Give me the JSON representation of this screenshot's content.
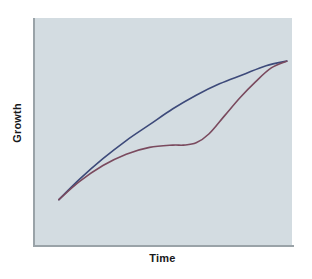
{
  "chart_data": {
    "type": "line",
    "title": "",
    "subtitle": "",
    "xlabel": "Time",
    "ylabel": "Growth",
    "grid": false,
    "legend": false,
    "legend_position": "none",
    "axis_ticks": false,
    "tick_labels": false,
    "xlim": [
      0,
      100
    ],
    "ylim": [
      0,
      100
    ],
    "plot_background": "#d3dce1",
    "figure_background": "#ffffff",
    "axis_color": "#9aa3a8",
    "axis_label_color": "#17191b",
    "annotations": [],
    "series": [
      {
        "name": "smooth-growth-curve",
        "color": "#3d4a7a",
        "line_width": 1.6,
        "shape": "concave-down steady growth",
        "x": [
          10,
          18,
          27,
          36,
          45,
          54,
          63,
          72,
          81,
          90,
          98
        ],
        "y": [
          20,
          29,
          38,
          46,
          53,
          60,
          66,
          71,
          75,
          79,
          81
        ]
      },
      {
        "name": "plateau-growth-curve",
        "color": "#7a4a5e",
        "line_width": 1.6,
        "shape": "rise, plateau, then steep rise to converge",
        "x": [
          10,
          18,
          27,
          36,
          45,
          54,
          58,
          63,
          68,
          74,
          80,
          86,
          92,
          98
        ],
        "y": [
          20,
          28,
          35,
          40,
          43,
          44,
          44,
          45,
          49,
          57,
          65,
          72,
          78,
          81
        ]
      }
    ]
  },
  "axes": {
    "x_title": "Time",
    "y_title": "Growth"
  }
}
